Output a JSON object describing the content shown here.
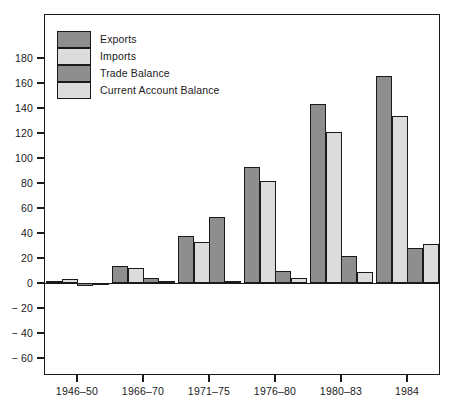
{
  "chart_data": {
    "type": "bar",
    "title": "",
    "subtitle": "",
    "xlabel": "",
    "ylabel": "",
    "ylim": [
      -60,
      180
    ],
    "ytick_step": 20,
    "yticks": [
      180,
      160,
      140,
      120,
      100,
      80,
      60,
      40,
      20,
      0,
      -20,
      -40,
      -60
    ],
    "ytick_labels": [
      "180",
      "160",
      "140",
      "120",
      "100",
      "80",
      "60",
      "40",
      "20",
      "0",
      "− 20",
      "− 40",
      "− 60"
    ],
    "grid": false,
    "legend_position": "upper-left",
    "categories": [
      "1946–50",
      "1966–70",
      "1971–75",
      "1976–80",
      "1980–83",
      "1984"
    ],
    "series": [
      {
        "name": "Exports",
        "color": "#8e8e8e",
        "values": [
          2,
          14,
          38,
          93,
          143,
          166
        ]
      },
      {
        "name": "Imports",
        "color": "#dcdcdc",
        "values": [
          3,
          12,
          33,
          82,
          121,
          134
        ]
      },
      {
        "name": "Trade Balance",
        "color": "#8e8e8e",
        "values": [
          -2,
          4,
          53,
          10,
          22,
          28
        ]
      },
      {
        "name": "Current Account Balance",
        "color": "#dcdcdc",
        "values": [
          -1,
          2,
          2,
          4,
          9,
          31
        ]
      }
    ]
  },
  "legend": {
    "items": [
      {
        "label": "Exports",
        "color": "#8e8e8e"
      },
      {
        "label": "Imports",
        "color": "#dcdcdc"
      },
      {
        "label": "Trade Balance",
        "color": "#8e8e8e"
      },
      {
        "label": "Current Account Balance",
        "color": "#dcdcdc"
      }
    ]
  },
  "axis": {
    "frame_color": "#1a1a1a"
  }
}
